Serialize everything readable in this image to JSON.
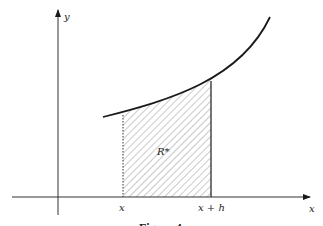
{
  "figure": {
    "axes": {
      "x_label": "x",
      "y_label": "y"
    },
    "curve": {
      "description": "increasing convex function y = f(x)",
      "x_domain": [
        0.7,
        3.7
      ]
    },
    "region": {
      "label": "R*",
      "left_bound_label": "x",
      "right_bound_label": "x + h",
      "fill": "diagonal hatching"
    },
    "caption": "Figure 4",
    "colors": {
      "line": "#1a1a1a",
      "hatch": "#7a7a7a"
    }
  }
}
